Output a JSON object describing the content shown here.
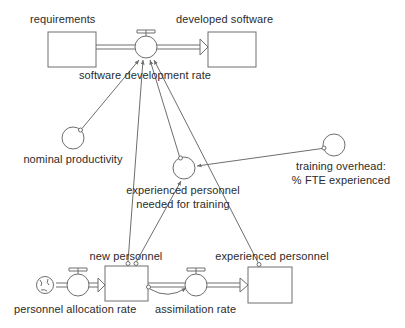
{
  "diagram": {
    "kind": "system-dynamics-stock-and-flow",
    "title_visible": false,
    "colors": {
      "stroke": "#6e6e6e",
      "text": "#2b2b2b",
      "background": "#ffffff",
      "fill": "#ffffff"
    },
    "stocks": [
      {
        "id": "requirements",
        "label": "requirements",
        "x": 48,
        "y": 32,
        "w": 48,
        "h": 35,
        "label_x": 30,
        "label_y": 13
      },
      {
        "id": "developed-software",
        "label": "developed software",
        "x": 208,
        "y": 32,
        "w": 48,
        "h": 35,
        "label_x": 176,
        "label_y": 13
      },
      {
        "id": "new-personnel",
        "label": "new personnel",
        "x": 105,
        "y": 266,
        "w": 43,
        "h": 35,
        "label_x": 126,
        "label_y": 250
      },
      {
        "id": "experienced-personnel",
        "label": "experienced personnel",
        "x": 248,
        "y": 267,
        "w": 44,
        "h": 36,
        "label_x": 272,
        "label_y": 250
      }
    ],
    "flows": [
      {
        "id": "software-development-rate",
        "label": "software development rate",
        "cx": 146,
        "cy": 47,
        "r": 11,
        "label_x": 145,
        "label_y": 69
      },
      {
        "id": "personnel-allocation-rate",
        "label": "personnel allocation rate",
        "cx": 78,
        "cy": 285,
        "r": 11,
        "label_x": 76,
        "label_y": 303
      },
      {
        "id": "assimilation-rate",
        "label": "assimilation rate",
        "cx": 196,
        "cy": 285,
        "r": 11,
        "label_x": 219,
        "label_y": 303
      }
    ],
    "auxiliaries": [
      {
        "id": "nominal-productivity",
        "label": "nominal productivity",
        "cx": 73,
        "cy": 138,
        "r": 11,
        "label_x": 73,
        "label_y": 153
      },
      {
        "id": "experienced-personnel-needed-for-training",
        "label": "experienced personnel",
        "label2": "needed for training",
        "cx": 184,
        "cy": 168,
        "r": 11,
        "label_x": 183,
        "label_y": 184,
        "label2_x": 183,
        "label2_y": 198
      },
      {
        "id": "training-overhead",
        "label": "training overhead:",
        "label2": "% FTE experienced",
        "cx": 334,
        "cy": 145,
        "r": 11,
        "label_x": 341,
        "label_y": 160,
        "label2_x": 341,
        "label2_y": 174
      }
    ],
    "sources": [
      {
        "id": "personnel-source-cloud",
        "cx": 45,
        "cy": 285
      }
    ],
    "connector_labels": [],
    "links": [
      {
        "from": "nominal-productivity",
        "to": "software-development-rate"
      },
      {
        "from": "new-personnel",
        "to": "software-development-rate"
      },
      {
        "from": "experienced-personnel-needed-for-training",
        "to": "software-development-rate"
      },
      {
        "from": "experienced-personnel",
        "to": "software-development-rate"
      },
      {
        "from": "training-overhead",
        "to": "experienced-personnel-needed-for-training"
      },
      {
        "from": "new-personnel",
        "to": "experienced-personnel-needed-for-training"
      },
      {
        "from": "new-personnel",
        "to": "assimilation-rate"
      }
    ],
    "pipes": [
      {
        "from": "requirements",
        "through": "software-development-rate",
        "to": "developed-software"
      },
      {
        "from": "personnel-source-cloud",
        "through": "personnel-allocation-rate",
        "to": "new-personnel"
      },
      {
        "from": "new-personnel",
        "through": "assimilation-rate",
        "to": "experienced-personnel"
      }
    ]
  }
}
